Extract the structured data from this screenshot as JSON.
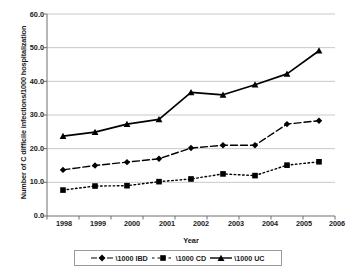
{
  "chart_data": {
    "type": "line",
    "title": "",
    "xlabel": "Year",
    "ylabel": "Number of C difficile infections/1000 hospitalization",
    "categories": [
      "1998",
      "1999",
      "2000",
      "2001",
      "2002",
      "2003",
      "2004",
      "2005",
      "2006"
    ],
    "x": [
      1998,
      1999,
      2000,
      2001,
      2002,
      2003,
      2004,
      2005,
      2006
    ],
    "series": [
      {
        "name": "\\1000 IBD",
        "marker": "diamond",
        "linestyle": "dashed",
        "color": "#000000",
        "values": [
          13.7,
          15.0,
          16.0,
          17.0,
          20.2,
          21.0,
          21.0,
          27.3,
          28.3
        ]
      },
      {
        "name": "\\1000 CD",
        "marker": "square",
        "linestyle": "dotted",
        "color": "#000000",
        "values": [
          7.7,
          8.9,
          9.0,
          10.2,
          11.0,
          12.5,
          12.0,
          15.1,
          16.1
        ]
      },
      {
        "name": "\\1000 UC",
        "marker": "triangle",
        "linestyle": "solid",
        "color": "#000000",
        "values": [
          23.7,
          24.9,
          27.3,
          28.7,
          36.7,
          36.0,
          39.0,
          42.2,
          49.1
        ]
      }
    ],
    "ylim": [
      0.0,
      60.0
    ],
    "ytick_labels": [
      "0.0",
      "10.0",
      "20.0",
      "30.0",
      "40.0",
      "50.0",
      "60.0"
    ],
    "ytick_values": [
      0,
      10,
      20,
      30,
      40,
      50,
      60
    ],
    "grid": true,
    "grid_axis": "y",
    "grid_color": "#c9c9c9",
    "legend_position": "bottom",
    "axis_color": "#6e6e6e",
    "background": "#ffffff"
  }
}
